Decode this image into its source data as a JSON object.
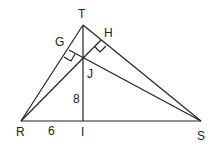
{
  "diagram": {
    "points": {
      "T": {
        "label": "T",
        "x": 83,
        "y": 25
      },
      "R": {
        "label": "R",
        "x": 21,
        "y": 121
      },
      "S": {
        "label": "S",
        "x": 201,
        "y": 121
      },
      "I": {
        "label": "I",
        "x": 83,
        "y": 121
      },
      "J": {
        "label": "J",
        "x": 83,
        "y": 57
      },
      "G": {
        "label": "G",
        "x": 69,
        "y": 50
      },
      "H": {
        "label": "H",
        "x": 101,
        "y": 40
      }
    },
    "lengths": {
      "JI": "8",
      "RI": "6"
    },
    "labels": {
      "T": "T",
      "G": "G",
      "H": "H",
      "J": "J",
      "R": "R",
      "S": "S",
      "I": "I",
      "len_JI": "8",
      "len_RI": "6"
    }
  }
}
